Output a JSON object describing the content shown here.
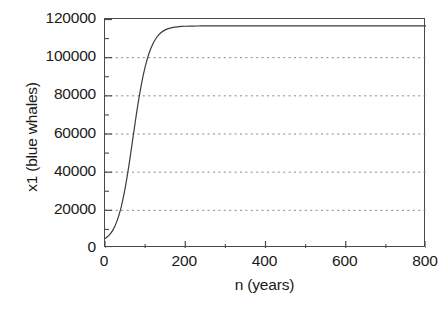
{
  "chart_data": {
    "type": "line",
    "title": "",
    "xlabel": "n (years)",
    "ylabel": "x1 (blue whales)",
    "xlim": [
      0,
      800
    ],
    "ylim": [
      0,
      120000
    ],
    "grid": true,
    "grid_axis": "y",
    "grid_style": "dotted",
    "grid_color": "#808080",
    "legend": null,
    "xticks": [
      0,
      200,
      400,
      600,
      800
    ],
    "xtick_labels": [
      "0",
      "200",
      "400",
      "600",
      "800"
    ],
    "xticks_minor": [
      100,
      300,
      500,
      700
    ],
    "yticks": [
      0,
      20000,
      40000,
      60000,
      80000,
      100000,
      120000
    ],
    "ytick_labels": [
      "0",
      "20000",
      "40000",
      "60000",
      "80000",
      "100000",
      "120000"
    ],
    "yticks_minor": [
      10000,
      30000,
      50000,
      70000,
      90000,
      110000
    ],
    "line_color": "#3c3c3c",
    "line_width": 1.2,
    "series": [
      {
        "name": "x1",
        "x": [
          0,
          10,
          20,
          30,
          40,
          50,
          60,
          70,
          80,
          90,
          100,
          110,
          120,
          130,
          140,
          150,
          160,
          170,
          180,
          190,
          200,
          220,
          240,
          260,
          280,
          300,
          350,
          400,
          450,
          500,
          550,
          600,
          650,
          700,
          750,
          800
        ],
        "values": [
          5000,
          6600,
          9500,
          14200,
          21200,
          31100,
          43800,
          58200,
          72500,
          85000,
          94900,
          102200,
          107300,
          110700,
          112900,
          114300,
          115100,
          115600,
          115900,
          116100,
          116200,
          116300,
          116350,
          116380,
          116390,
          116400,
          116400,
          116400,
          116400,
          116400,
          116400,
          116400,
          116400,
          116400,
          116400,
          116400
        ]
      }
    ],
    "plateau_value": 116400,
    "initial_value": 5000,
    "inflection_x": 72,
    "inflection_y": 60000
  },
  "axes": {
    "y_tick_labels": [
      "120000",
      "100000",
      "80000",
      "60000",
      "40000",
      "20000",
      "0"
    ],
    "x_tick_labels": [
      "0",
      "200",
      "400",
      "600",
      "800"
    ],
    "x_title": "n (years)",
    "y_title": "x1 (blue whales)"
  }
}
